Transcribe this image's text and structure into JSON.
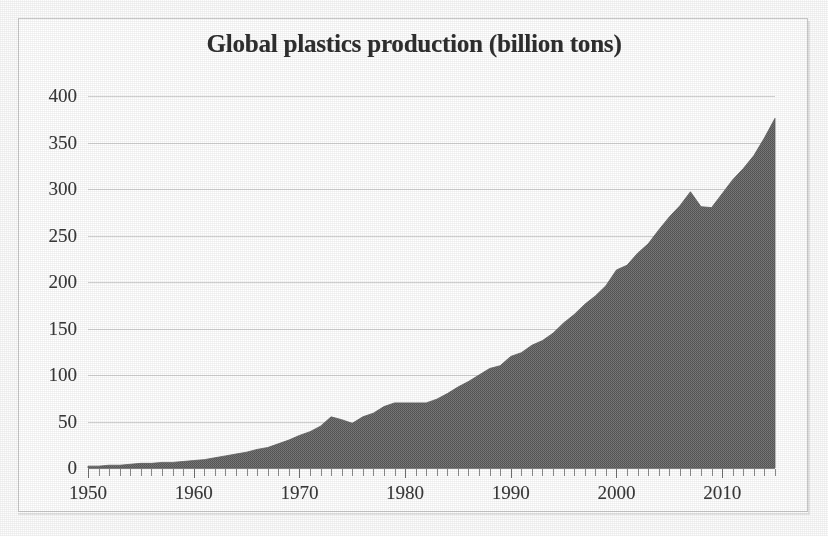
{
  "chart_data": {
    "type": "area",
    "title": "Global plastics production (billion tons)",
    "xlabel": "",
    "ylabel": "",
    "ylim": [
      0,
      400
    ],
    "xlim": [
      1950,
      2015
    ],
    "yticks": [
      0,
      50,
      100,
      150,
      200,
      250,
      300,
      350,
      400
    ],
    "xticks": [
      1950,
      1960,
      1970,
      1980,
      1990,
      2000,
      2010
    ],
    "grid": true,
    "legend": "none",
    "series_color": "#6e6e6e",
    "grid_color": "#d2d2d2",
    "text_color": "#3a3a3a",
    "x": [
      1950,
      1951,
      1952,
      1953,
      1954,
      1955,
      1956,
      1957,
      1958,
      1959,
      1960,
      1961,
      1962,
      1963,
      1964,
      1965,
      1966,
      1967,
      1968,
      1969,
      1970,
      1971,
      1972,
      1973,
      1974,
      1975,
      1976,
      1977,
      1978,
      1979,
      1980,
      1981,
      1982,
      1983,
      1984,
      1985,
      1986,
      1987,
      1988,
      1989,
      1990,
      1991,
      1992,
      1993,
      1994,
      1995,
      1996,
      1997,
      1998,
      1999,
      2000,
      2001,
      2002,
      2003,
      2004,
      2005,
      2006,
      2007,
      2008,
      2009,
      2010,
      2011,
      2012,
      2013,
      2014,
      2015
    ],
    "values": [
      2,
      2,
      3,
      3,
      4,
      5,
      5,
      6,
      6,
      7,
      8,
      9,
      11,
      13,
      15,
      17,
      20,
      22,
      26,
      30,
      35,
      39,
      45,
      55,
      52,
      48,
      55,
      59,
      66,
      70,
      70,
      70,
      70,
      74,
      80,
      87,
      93,
      100,
      107,
      110,
      120,
      124,
      132,
      137,
      145,
      156,
      165,
      176,
      185,
      196,
      213,
      218,
      231,
      241,
      256,
      270,
      282,
      297,
      281,
      280,
      295,
      310,
      322,
      336,
      355,
      376
    ],
    "series_name": "Global plastics production"
  },
  "chart": {
    "title": "Global plastics production (billion tons)",
    "y_tick_labels": [
      "400",
      "350",
      "300",
      "250",
      "200",
      "150",
      "100",
      "50",
      "0"
    ],
    "x_tick_labels": [
      "1950",
      "1960",
      "1970",
      "1980",
      "1990",
      "2000",
      "2010"
    ]
  }
}
